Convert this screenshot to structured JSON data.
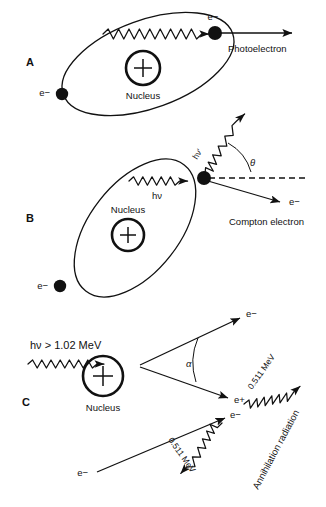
{
  "figure": {
    "background_color": "#ffffff",
    "ink_color": "#111111",
    "width": 326,
    "height": 507
  },
  "panels": [
    {
      "id": "A",
      "letter": "A",
      "name": "photoelectric-effect",
      "nucleus_label": "Nucleus",
      "nucleus_charge": "+",
      "incoming_photon_label": "",
      "ejected_particle_label": "e−",
      "orbital_electron_label": "e−",
      "outcome_label": "Photoelectron"
    },
    {
      "id": "B",
      "letter": "B",
      "name": "compton-scattering",
      "nucleus_label": "Nucleus",
      "nucleus_charge": "+",
      "incoming_photon_label": "hν",
      "scattered_photon_label": "hν'",
      "angle_label": "θ",
      "ejected_particle_label": "e−",
      "orbital_electron_label": "e−",
      "outcome_label": "Compton electron"
    },
    {
      "id": "C",
      "letter": "C",
      "name": "pair-production",
      "nucleus_label": "Nucleus",
      "nucleus_charge": "+",
      "incoming_photon_label": "hν > 1.02 MeV",
      "angle_label": "α",
      "electron_label": "e−",
      "positron_label": "e+",
      "annihilation_electron_label": "e−",
      "incoming_electron_label": "e−",
      "gamma_upper_label": "0.511 MeV",
      "gamma_lower_label": "0.511 MeV",
      "annihilation_label": "Annihilation radiation"
    }
  ]
}
